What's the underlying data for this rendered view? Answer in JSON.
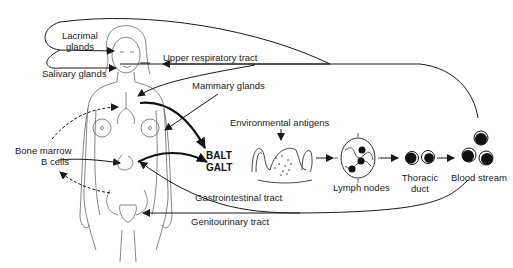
{
  "diagram": {
    "type": "mucosal-immune-system-lymphocyte-circulation",
    "labels": {
      "lacrimal": "Lacrimal\nglands",
      "lacrimal_line1": "Lacrimal",
      "lacrimal_line2": "glands",
      "salivary": "Salivary glands",
      "upper_resp": "Upper respiratory tract",
      "mammary": "Mammary glands",
      "bone_marrow_line1": "Bone marrow",
      "bone_marrow_line2": "B cells",
      "balt": "BALT",
      "galt": "GALT",
      "env_antigens": "Environmental antigens",
      "lymph_nodes": "Lymph nodes",
      "thoracic_line1": "Thoracic",
      "thoracic_line2": "duct",
      "blood_stream": "Blood stream",
      "gastro": "Gastrointestinal tract",
      "genito": "Genitourinary tract"
    },
    "colors": {
      "line": "#1a1a1a",
      "text": "#222222",
      "background": "#ffffff",
      "outline": "#555555"
    }
  }
}
